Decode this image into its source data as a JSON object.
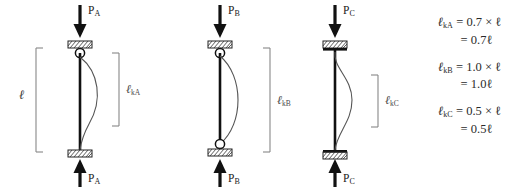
{
  "diagram": {
    "span_label": "ℓ",
    "cases": [
      {
        "id": "a",
        "load_symbol": "P",
        "load_subscript": "A",
        "effective_length_symbol": "ℓ",
        "effective_length_subscript": "kA",
        "top_support": "pinned",
        "bottom_support": "fixed",
        "factor": 0.7
      },
      {
        "id": "b",
        "load_symbol": "P",
        "load_subscript": "B",
        "effective_length_symbol": "ℓ",
        "effective_length_subscript": "kB",
        "top_support": "pinned",
        "bottom_support": "pinned",
        "factor": 1.0
      },
      {
        "id": "c",
        "load_symbol": "P",
        "load_subscript": "C",
        "effective_length_symbol": "ℓ",
        "effective_length_subscript": "kC",
        "top_support": "fixed",
        "bottom_support": "fixed",
        "factor": 0.5
      }
    ]
  },
  "equations": [
    {
      "symbol": "ℓ",
      "subscript": "kA",
      "expression": "= 0.7 × ℓ",
      "result": "= 0.7ℓ"
    },
    {
      "symbol": "ℓ",
      "subscript": "kB",
      "expression": "= 1.0 × ℓ",
      "result": "= 1.0ℓ"
    },
    {
      "symbol": "ℓ",
      "subscript": "kC",
      "expression": "= 0.5 × ℓ",
      "result": "= 0.5ℓ"
    }
  ],
  "colors": {
    "line": "#1a1a1a",
    "curve": "#555555",
    "bracket": "#777777",
    "text": "#2a2a2a"
  }
}
